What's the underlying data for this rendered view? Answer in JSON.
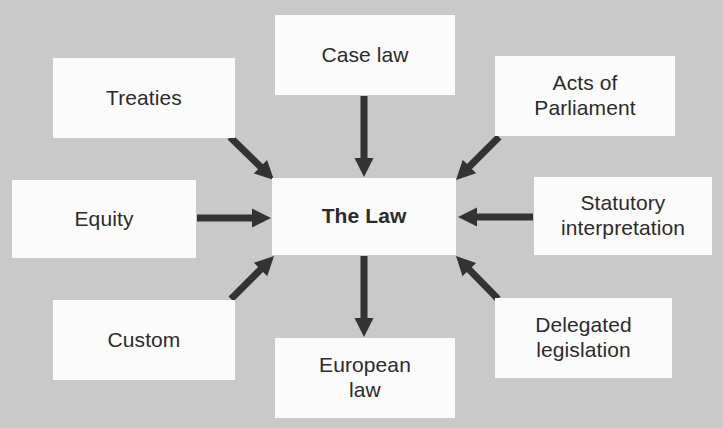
{
  "diagram": {
    "background_color": "#c9c9c9",
    "node_fill_color": "#fbfbfb",
    "text_color": "#2b2b2b",
    "arrow_color": "#333333",
    "center": {
      "label": "The Law",
      "name": "the-law"
    },
    "nodes": [
      {
        "name": "treaties",
        "label": "Treaties",
        "x": 53,
        "y": 58,
        "w": 182,
        "h": 80
      },
      {
        "name": "case-law",
        "label": "Case law",
        "x": 275,
        "y": 15,
        "w": 180,
        "h": 80
      },
      {
        "name": "acts-of-parliament",
        "label": "Acts of\nParliament",
        "x": 495,
        "y": 56,
        "w": 180,
        "h": 80
      },
      {
        "name": "equity",
        "label": "Equity",
        "x": 12,
        "y": 180,
        "w": 184,
        "h": 78
      },
      {
        "name": "the-law",
        "label": "The Law",
        "x": 272,
        "y": 178,
        "w": 184,
        "h": 77
      },
      {
        "name": "statutory-interpretation",
        "label": "Statutory\ninterpretation",
        "x": 534,
        "y": 177,
        "w": 178,
        "h": 78
      },
      {
        "name": "custom",
        "label": "Custom",
        "x": 53,
        "y": 300,
        "w": 182,
        "h": 80
      },
      {
        "name": "european-law",
        "label": "European\nlaw",
        "x": 275,
        "y": 338,
        "w": 180,
        "h": 80
      },
      {
        "name": "delegated-legislation",
        "label": "Delegated\nlegislation",
        "x": 495,
        "y": 298,
        "w": 177,
        "h": 80
      }
    ],
    "arrows": [
      {
        "name": "arrow-treaties-to-the-law",
        "from": "treaties",
        "to": "the-law",
        "x1": 230,
        "y1": 137,
        "x2": 274,
        "y2": 180,
        "direction": "down-right"
      },
      {
        "name": "arrow-case-law-to-the-law",
        "from": "case-law",
        "to": "the-law",
        "x1": 364,
        "y1": 96,
        "x2": 364,
        "y2": 177,
        "direction": "down"
      },
      {
        "name": "arrow-acts-of-parliament-to-the-law",
        "from": "acts-of-parliament",
        "to": "the-law",
        "x1": 499,
        "y1": 137,
        "x2": 456,
        "y2": 180,
        "direction": "down-left"
      },
      {
        "name": "arrow-equity-to-the-law",
        "from": "equity",
        "to": "the-law",
        "x1": 197,
        "y1": 218,
        "x2": 271,
        "y2": 218,
        "direction": "right"
      },
      {
        "name": "arrow-statutory-interpretation-to-the-law",
        "from": "statutory-interpretation",
        "to": "the-law",
        "x1": 533,
        "y1": 217,
        "x2": 458,
        "y2": 217,
        "direction": "left"
      },
      {
        "name": "arrow-custom-to-the-law",
        "from": "custom",
        "to": "the-law",
        "x1": 231,
        "y1": 299,
        "x2": 274,
        "y2": 256,
        "direction": "up-right"
      },
      {
        "name": "arrow-the-law-to-european-law",
        "from": "the-law",
        "to": "european-law",
        "x1": 364,
        "y1": 256,
        "x2": 364,
        "y2": 337,
        "direction": "down"
      },
      {
        "name": "arrow-delegated-legislation-to-the-law",
        "from": "delegated-legislation",
        "to": "the-law",
        "x1": 498,
        "y1": 299,
        "x2": 456,
        "y2": 256,
        "direction": "up-left"
      }
    ]
  }
}
